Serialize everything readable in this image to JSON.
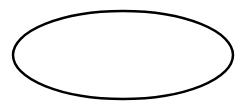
{
  "canvas": {
    "width": 246,
    "height": 109,
    "background": "#ffffff"
  },
  "shapes": [
    {
      "type": "ellipse",
      "cx": 123,
      "cy": 55,
      "rx": 110,
      "ry": 44,
      "stroke": "#000000",
      "stroke_width": 2.5,
      "fill": "#ffffff",
      "label": ""
    }
  ]
}
